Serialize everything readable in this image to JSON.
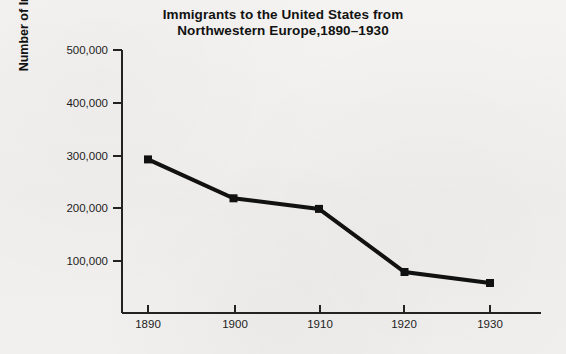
{
  "chart_data": {
    "type": "line",
    "title": "Immigrants to the United States from Northwestern Europe,1890–1930",
    "title_lines": [
      "Immigrants to the United States from",
      "Northwestern Europe,1890–1930"
    ],
    "xlabel": "",
    "ylabel": "Number of Immigrants Per Year",
    "x": [
      1890,
      1900,
      1910,
      1920,
      1930
    ],
    "values": [
      292000,
      218000,
      198000,
      78000,
      57000
    ],
    "categories": [
      "1890",
      "1900",
      "1910",
      "1920",
      "1930"
    ],
    "xtick_labels": [
      "1890",
      "1900",
      "1910",
      "1920",
      "1930"
    ],
    "ytick_labels": [
      "100,000",
      "200,000",
      "300,000",
      "400,000",
      "500,000"
    ],
    "ytick_values": [
      100000,
      200000,
      300000,
      400000,
      500000
    ],
    "ylim": [
      0,
      500000
    ],
    "xlim": [
      1885,
      1936
    ],
    "grid": false,
    "legend": false,
    "legend_position": "none",
    "marker": "square",
    "line_color": "#111111",
    "marker_color": "#111111",
    "axis_color": "#222222",
    "background_color": "#f2f1ef"
  }
}
